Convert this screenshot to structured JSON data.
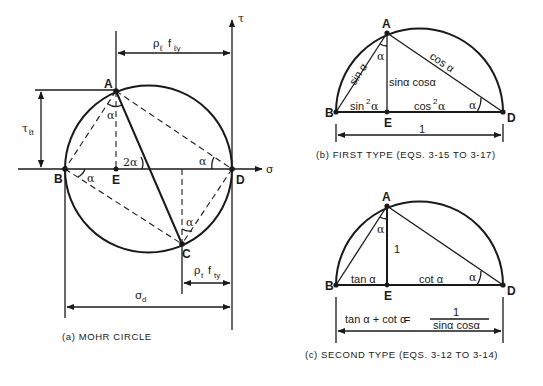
{
  "figure_a": {
    "caption": "(a)  MOHR CIRCLE",
    "points": {
      "A": "A",
      "B": "B",
      "C": "C",
      "D": "D",
      "E": "E"
    },
    "axis_sigma": "σ",
    "axis_tau": "τ",
    "angle_alpha": "α",
    "angle_2alpha": "2α",
    "dim_top": {
      "rho": "ρ",
      "rho_sub": "ℓ",
      "f": "f",
      "f_sub": "ℓy"
    },
    "dim_left": {
      "tau": "τ",
      "tau_sub": "ℓt"
    },
    "dim_right": {
      "rho": "ρ",
      "rho_sub": "t",
      "f": "f",
      "f_sub": "ty"
    },
    "dim_bottom": {
      "sigma": "σ",
      "sigma_sub": "d"
    }
  },
  "figure_b": {
    "caption": "(b)  FIRST TYPE (EQS. 3-15  TO  3-17)",
    "points": {
      "A": "A",
      "B": "B",
      "D": "D",
      "E": "E"
    },
    "angle_alpha": "α",
    "label_AB": "sin α",
    "label_AD": "cos α",
    "label_AE": "sinα cosα",
    "label_BE": "sin",
    "label_BE_sup": "2",
    "label_BE_tail": "α",
    "label_ED": "cos",
    "label_ED_sup": "2",
    "label_ED_tail": "α",
    "dim_total": "1"
  },
  "figure_c": {
    "caption": "(c)  SECOND TYPE (EQS. 3-12  TO  3-14)",
    "points": {
      "A": "A",
      "B": "B",
      "D": "D",
      "E": "E"
    },
    "angle_alpha": "α",
    "label_AE": "1",
    "label_BE": "tan α",
    "label_ED": "cot α",
    "formula_lhs": "tan α + cot α",
    "formula_eq": "=",
    "formula_num": "1",
    "formula_den": "sinα cosα"
  }
}
